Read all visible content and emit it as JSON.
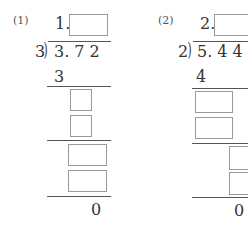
{
  "problems": [
    {
      "label": "(1)",
      "quotient_prefix": "1.",
      "divisor": "3",
      "dividend": "3. 7 2",
      "first_product": "3",
      "remainder": "0"
    },
    {
      "label": "(2)",
      "quotient_prefix": "2.",
      "divisor": "2",
      "dividend": "5. 4 4",
      "first_product": "4",
      "remainder": "0"
    }
  ]
}
